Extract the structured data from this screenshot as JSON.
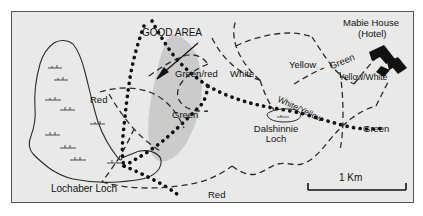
{
  "map": {
    "title_annotation": "GOOD AREA",
    "background_color": "#e9e9e9",
    "frame_color": "#555555",
    "good_area_color": "#c6c6c6",
    "building_color": "#111111",
    "labels": {
      "good_area": "GOOD AREA",
      "red_left": "Red",
      "green_red": "Green/red",
      "green_left": "Green",
      "white": "White",
      "yellow": "Yellow",
      "green_upper": "Green",
      "yellow_white": "Yellow/White",
      "white_yellow": "White/Yellow",
      "green_right": "Green",
      "red_bottom": "Red",
      "dalshinnie_loch_line1": "Dalshinnie",
      "dalshinnie_loch_line2": "Loch",
      "lochaber_loch": "Lochaber Loch",
      "mabie_house_line1": "Mabie House",
      "mabie_house_line2": "(Hotel)"
    },
    "scale_bar": {
      "label": "1 Km",
      "length_px": 98
    },
    "icons": {
      "pointer": "arrow-icon",
      "hotel": "building-icon",
      "water_body": "loch-icon"
    }
  }
}
